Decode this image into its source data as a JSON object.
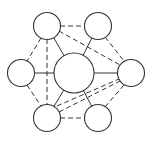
{
  "diagram": {
    "type": "network-graph",
    "colors": {
      "stroke": "#333333",
      "fill": "#ffffff",
      "background": "#ffffff"
    },
    "nodes": [
      {
        "id": "center",
        "cx": 74,
        "cy": 73,
        "r": 20
      },
      {
        "id": "top-left",
        "cx": 47,
        "cy": 26,
        "r": 13.5
      },
      {
        "id": "top-right",
        "cx": 98,
        "cy": 26,
        "r": 13.5
      },
      {
        "id": "left",
        "cx": 21,
        "cy": 73,
        "r": 13.5
      },
      {
        "id": "right",
        "cx": 131,
        "cy": 73,
        "r": 13.5
      },
      {
        "id": "bottom-left",
        "cx": 47,
        "cy": 118,
        "r": 13.5
      },
      {
        "id": "bottom-right",
        "cx": 98,
        "cy": 118,
        "r": 13.5
      }
    ],
    "edges": [
      {
        "from": "center",
        "to": "top-left",
        "style": "solid"
      },
      {
        "from": "center",
        "to": "top-right",
        "style": "solid"
      },
      {
        "from": "center",
        "to": "left",
        "style": "solid"
      },
      {
        "from": "center",
        "to": "right",
        "style": "solid"
      },
      {
        "from": "center",
        "to": "bottom-left",
        "style": "solid"
      },
      {
        "from": "center",
        "to": "bottom-right",
        "style": "solid"
      },
      {
        "from": "top-left",
        "to": "top-right",
        "style": "dashed"
      },
      {
        "from": "top-left",
        "to": "left",
        "style": "dashed"
      },
      {
        "from": "top-left",
        "to": "bottom-left",
        "style": "dashed"
      },
      {
        "from": "top-left",
        "to": "right",
        "style": "dashed"
      },
      {
        "from": "top-right",
        "to": "right",
        "style": "dashed"
      },
      {
        "from": "left",
        "to": "bottom-left",
        "style": "dashed"
      },
      {
        "from": "bottom-left",
        "to": "bottom-right",
        "style": "dashed"
      },
      {
        "from": "bottom-right",
        "to": "right",
        "style": "dashed"
      },
      {
        "from": "bottom-left",
        "to": "right",
        "style": "dashed"
      }
    ]
  }
}
